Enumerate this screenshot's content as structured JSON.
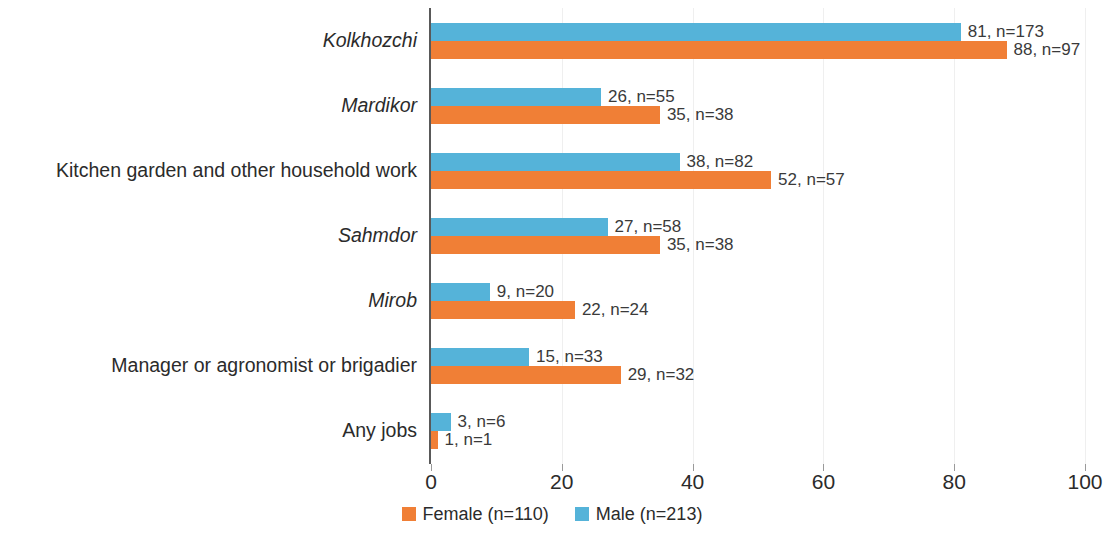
{
  "chart_data": {
    "type": "bar",
    "orientation": "horizontal",
    "title": "",
    "subtitle": "",
    "xlabel": "",
    "ylabel": "",
    "xlim": [
      0,
      100
    ],
    "xticks": [
      "0",
      "20",
      "40",
      "60",
      "80",
      "100"
    ],
    "grid": "vertical-light",
    "legend_position": "bottom-center",
    "categories": [
      "Kolkhozchi",
      "Mardikor",
      "Kitchen garden and other household work",
      "Sahmdor",
      "Mirob",
      "Manager or agronomist or brigadier",
      "Any jobs"
    ],
    "category_styles": [
      "italic",
      "italic",
      "normal",
      "italic",
      "italic",
      "normal",
      "normal"
    ],
    "series": [
      {
        "name": "Male (n=213)",
        "color": "#55B3D9",
        "values": [
          81,
          26,
          38,
          27,
          9,
          15,
          3
        ],
        "counts": [
          173,
          55,
          82,
          58,
          20,
          33,
          6
        ],
        "labels": [
          "81, n=173",
          "26, n=55",
          "38, n=82",
          "27, n=58",
          "9, n=20",
          "15, n=33",
          "3, n=6"
        ]
      },
      {
        "name": "Female (n=110)",
        "color": "#F07F36",
        "values": [
          88,
          35,
          52,
          35,
          22,
          29,
          1
        ],
        "counts": [
          97,
          38,
          57,
          38,
          24,
          32,
          1
        ],
        "labels": [
          "88, n=97",
          "35, n=38",
          "52, n=57",
          "35, n=38",
          "22, n=24",
          "29, n=32",
          "1, n=1"
        ]
      }
    ],
    "legend": [
      {
        "label": "Female (n=110)",
        "color": "#F07F36",
        "swatch": "female"
      },
      {
        "label": "Male (n=213)",
        "color": "#55B3D9",
        "swatch": "male"
      }
    ]
  }
}
